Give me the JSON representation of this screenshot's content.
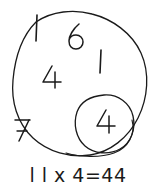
{
  "diagram": {
    "ink_color": "#1a1a1a",
    "background_color": "#ffffff",
    "outer_circle": {
      "name": "outer-circle",
      "cx": 79,
      "cy": 84,
      "rx": 66,
      "ry": 71
    },
    "inner_circle": {
      "name": "inner-circle",
      "cx": 104,
      "cy": 123,
      "rx": 29,
      "ry": 29
    },
    "digits": [
      {
        "id": "one-top",
        "label": "l",
        "x": 31,
        "y": 14
      },
      {
        "id": "six",
        "label": "6",
        "x": 66,
        "y": 21
      },
      {
        "id": "one-right",
        "label": "l",
        "x": 96,
        "y": 47
      },
      {
        "id": "four-left",
        "label": "4",
        "x": 42,
        "y": 65
      },
      {
        "id": "seven",
        "label": "7",
        "x": 13,
        "y": 117
      },
      {
        "id": "four-inner",
        "label": "4",
        "x": 96,
        "y": 110
      }
    ]
  },
  "equation": {
    "text": "l l x 4=44",
    "plain": "11 x 4=44",
    "left_operand": "11",
    "operator": "x",
    "right_operand": "4",
    "equals": "=",
    "result": "44"
  }
}
